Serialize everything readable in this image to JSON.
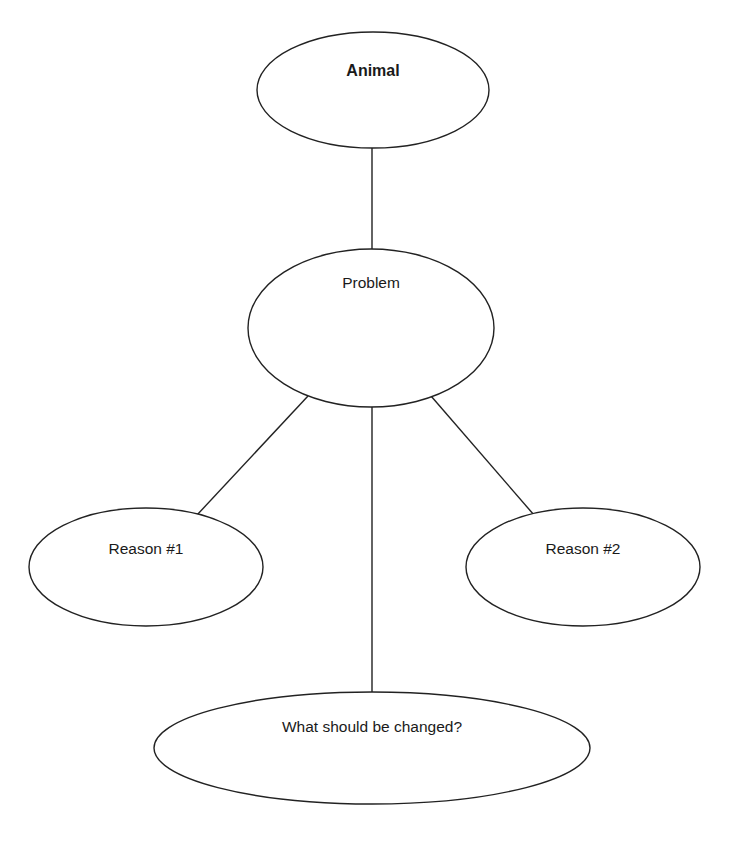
{
  "diagram": {
    "type": "graphic-organizer",
    "stroke_color": "#222222",
    "background": "#ffffff",
    "nodes": [
      {
        "id": "animal",
        "label": "Animal",
        "bold": true,
        "cx": 373,
        "cy": 90,
        "rx": 116,
        "ry": 58,
        "label_y": 62
      },
      {
        "id": "problem",
        "label": "Problem",
        "bold": false,
        "cx": 371,
        "cy": 328,
        "rx": 123,
        "ry": 79,
        "label_y": 274
      },
      {
        "id": "reason1",
        "label": "Reason #1",
        "bold": false,
        "cx": 146,
        "cy": 567,
        "rx": 117,
        "ry": 59,
        "label_y": 540
      },
      {
        "id": "reason2",
        "label": "Reason #2",
        "bold": false,
        "cx": 583,
        "cy": 567,
        "rx": 117,
        "ry": 59,
        "label_y": 540
      },
      {
        "id": "change",
        "label": "What should be changed?",
        "bold": false,
        "cx": 372,
        "cy": 748,
        "rx": 218,
        "ry": 56,
        "label_y": 718
      }
    ],
    "edges": [
      {
        "from": "animal",
        "to": "problem",
        "x1": 372,
        "y1": 148,
        "x2": 372,
        "y2": 249
      },
      {
        "from": "problem",
        "to": "reason1",
        "x1": 308,
        "y1": 396,
        "x2": 197,
        "y2": 515
      },
      {
        "from": "problem",
        "to": "change",
        "x1": 372,
        "y1": 407,
        "x2": 372,
        "y2": 692
      },
      {
        "from": "problem",
        "to": "reason2",
        "x1": 431,
        "y1": 396,
        "x2": 534,
        "y2": 515
      }
    ]
  }
}
